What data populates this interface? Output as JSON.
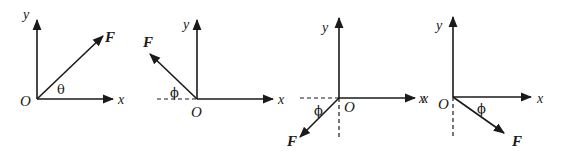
{
  "figure": {
    "colors": {
      "ink": "#1a1a1a",
      "background": "#ffffff"
    },
    "panels": [
      {
        "id": "panel-1",
        "labels": {
          "y_axis": "y",
          "x_axis": "x",
          "origin": "O",
          "vector": "F",
          "angle": "θ"
        },
        "vector_direction": "up-right (first quadrant)",
        "angle_reference": "measured from +x axis"
      },
      {
        "id": "panel-2",
        "labels": {
          "y_axis": "y",
          "x_axis": "x",
          "origin": "O",
          "vector": "F",
          "angle": "ϕ"
        },
        "vector_direction": "up-left (second quadrant)",
        "angle_reference": "measured from dashed −x axis"
      },
      {
        "id": "panel-3",
        "labels": {
          "y_axis": "y",
          "x_axis": "x",
          "neg_x_axis": "x",
          "origin": "O",
          "vector": "F",
          "angle": "ϕ"
        },
        "vector_direction": "down-left (third quadrant)",
        "angle_reference": "measured from dashed −x axis"
      },
      {
        "id": "panel-4",
        "labels": {
          "y_axis": "y",
          "x_axis": "x",
          "neg_x_axis": "x",
          "origin": "O",
          "vector": "F",
          "angle": "ϕ"
        },
        "vector_direction": "down-right (fourth quadrant)",
        "angle_reference": "measured from +x axis"
      }
    ]
  }
}
